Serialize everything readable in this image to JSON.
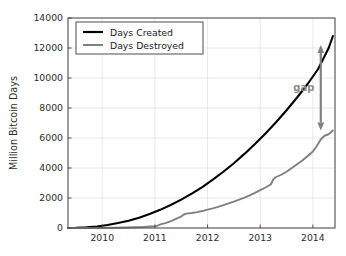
{
  "chart_data": {
    "type": "line",
    "title": "",
    "xlabel": "",
    "ylabel": "Million Bitcoin Days",
    "xlim": [
      2009.35,
      2014.42
    ],
    "ylim": [
      0,
      14000
    ],
    "grid": true,
    "legend_position": "upper left",
    "xticks": [
      "2010",
      "2011",
      "2012",
      "2013",
      "2014"
    ],
    "xtick_values": [
      2010,
      2011,
      2012,
      2013,
      2014
    ],
    "yticks": [
      "0",
      "2000",
      "4000",
      "6000",
      "8000",
      "10000",
      "12000",
      "14000"
    ],
    "ytick_values": [
      0,
      2000,
      4000,
      6000,
      8000,
      10000,
      12000,
      14000
    ],
    "series": [
      {
        "name": "Days Created",
        "color": "#000000",
        "x": [
          2009.35,
          2009.5,
          2009.7,
          2009.9,
          2010.1,
          2010.3,
          2010.5,
          2010.7,
          2010.9,
          2011.1,
          2011.3,
          2011.5,
          2011.7,
          2011.9,
          2012.1,
          2012.3,
          2012.5,
          2012.7,
          2012.9,
          2013.1,
          2013.3,
          2013.5,
          2013.7,
          2013.9,
          2014.1,
          2014.3,
          2014.38
        ],
        "values": [
          0,
          8,
          40,
          105,
          200,
          330,
          490,
          690,
          930,
          1210,
          1530,
          1890,
          2290,
          2730,
          3220,
          3750,
          4320,
          4940,
          5600,
          6300,
          7050,
          7850,
          8700,
          9600,
          10600,
          12000,
          12800
        ]
      },
      {
        "name": "Days Destroyed",
        "color": "#808080",
        "x": [
          2009.35,
          2009.7,
          2010.0,
          2010.3,
          2010.5,
          2010.65,
          2010.75,
          2010.8,
          2010.9,
          2011.0,
          2011.05,
          2011.12,
          2011.2,
          2011.28,
          2011.35,
          2011.42,
          2011.5,
          2011.55,
          2011.6,
          2011.7,
          2011.8,
          2011.9,
          2012.0,
          2012.1,
          2012.2,
          2012.3,
          2012.4,
          2012.5,
          2012.6,
          2012.7,
          2012.8,
          2012.9,
          2013.0,
          2013.1,
          2013.2,
          2013.25,
          2013.3,
          2013.4,
          2013.5,
          2013.6,
          2013.7,
          2013.8,
          2013.9,
          2014.0,
          2014.08,
          2014.15,
          2014.22,
          2014.3,
          2014.38
        ],
        "values": [
          0,
          2,
          8,
          18,
          30,
          45,
          60,
          75,
          95,
          120,
          160,
          260,
          330,
          420,
          520,
          640,
          760,
          900,
          960,
          1000,
          1060,
          1130,
          1220,
          1310,
          1410,
          1520,
          1640,
          1760,
          1890,
          2030,
          2180,
          2340,
          2520,
          2700,
          2900,
          3250,
          3400,
          3550,
          3750,
          4000,
          4250,
          4500,
          4800,
          5100,
          5500,
          5900,
          6150,
          6250,
          6500
        ]
      }
    ],
    "annotations": [
      {
        "name": "gap",
        "label": "gap",
        "x": 2014.15,
        "y_top": 12200,
        "y_bottom": 6500,
        "color": "#808080",
        "style": "double-headed-arrow"
      }
    ]
  },
  "legend": {
    "entries": [
      {
        "label": "Days Created",
        "color": "#000000"
      },
      {
        "label": "Days Destroyed",
        "color": "#808080"
      }
    ]
  },
  "axes": {
    "ylabel": "Million Bitcoin Days",
    "ytick_labels": [
      "14000",
      "12000",
      "10000",
      "8000",
      "6000",
      "4000",
      "2000",
      "0"
    ],
    "xtick_labels": [
      "2010",
      "2011",
      "2012",
      "2013",
      "2014"
    ]
  },
  "annotation": {
    "gap_label": "gap"
  }
}
